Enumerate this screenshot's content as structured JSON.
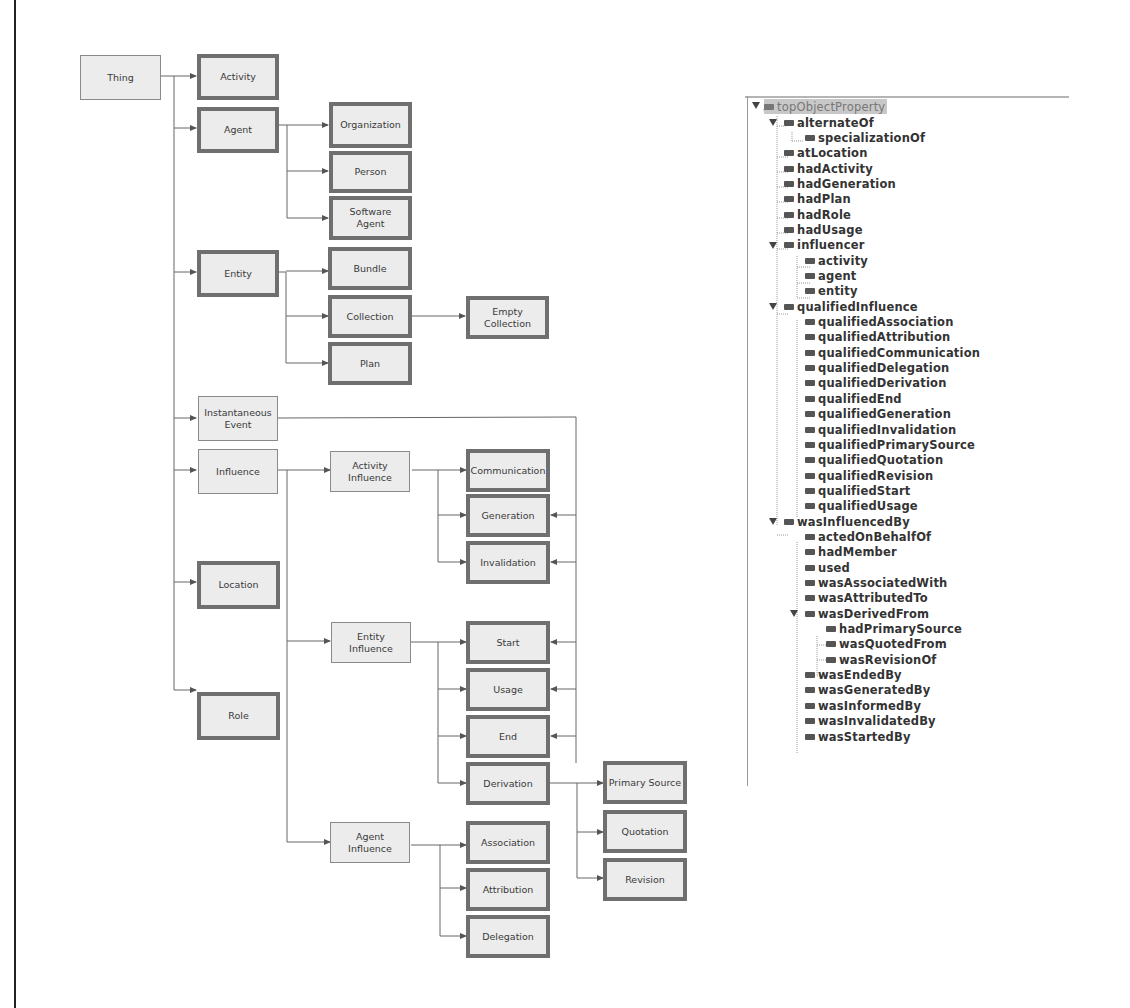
{
  "diagram": {
    "nodes": {
      "thing": "Thing",
      "activity": "Activity",
      "agent": "Agent",
      "organization": "Organization",
      "person": "Person",
      "software_agent": "Software\nAgent",
      "entity": "Entity",
      "bundle": "Bundle",
      "collection": "Collection",
      "empty_collection": "Empty\nCollection",
      "plan": "Plan",
      "instantaneous_event": "Instantaneous\nEvent",
      "influence": "Influence",
      "location": "Location",
      "role": "Role",
      "activity_influence": "Activity\nInfluence",
      "communication": "Communication",
      "generation": "Generation",
      "invalidation": "Invalidation",
      "entity_influence": "Entity\nInfluence",
      "start": "Start",
      "usage": "Usage",
      "end": "End",
      "derivation": "Derivation",
      "primary_source": "Primary Source",
      "quotation": "Quotation",
      "revision": "Revision",
      "agent_influence": "Agent\nInfluence",
      "association": "Association",
      "attribution": "Attribution",
      "delegation": "Delegation"
    }
  },
  "property_tree": {
    "root": "topObjectProperty",
    "items": [
      {
        "label": "alternateOf",
        "depth": 1,
        "expanded": true
      },
      {
        "label": "specializationOf",
        "depth": 2
      },
      {
        "label": "atLocation",
        "depth": 1
      },
      {
        "label": "hadActivity",
        "depth": 1
      },
      {
        "label": "hadGeneration",
        "depth": 1
      },
      {
        "label": "hadPlan",
        "depth": 1
      },
      {
        "label": "hadRole",
        "depth": 1
      },
      {
        "label": "hadUsage",
        "depth": 1
      },
      {
        "label": "influencer",
        "depth": 1,
        "expanded": true
      },
      {
        "label": "activity",
        "depth": 2
      },
      {
        "label": "agent",
        "depth": 2
      },
      {
        "label": "entity",
        "depth": 2
      },
      {
        "label": "qualifiedInfluence",
        "depth": 1,
        "expanded": true
      },
      {
        "label": "qualifiedAssociation",
        "depth": 2
      },
      {
        "label": "qualifiedAttribution",
        "depth": 2
      },
      {
        "label": "qualifiedCommunication",
        "depth": 2
      },
      {
        "label": "qualifiedDelegation",
        "depth": 2
      },
      {
        "label": "qualifiedDerivation",
        "depth": 2
      },
      {
        "label": "qualifiedEnd",
        "depth": 2
      },
      {
        "label": "qualifiedGeneration",
        "depth": 2
      },
      {
        "label": "qualifiedInvalidation",
        "depth": 2
      },
      {
        "label": "qualifiedPrimarySource",
        "depth": 2
      },
      {
        "label": "qualifiedQuotation",
        "depth": 2
      },
      {
        "label": "qualifiedRevision",
        "depth": 2
      },
      {
        "label": "qualifiedStart",
        "depth": 2
      },
      {
        "label": "qualifiedUsage",
        "depth": 2
      },
      {
        "label": "wasInfluencedBy",
        "depth": 1,
        "expanded": true
      },
      {
        "label": "actedOnBehalfOf",
        "depth": 2
      },
      {
        "label": "hadMember",
        "depth": 2
      },
      {
        "label": "used",
        "depth": 2
      },
      {
        "label": "wasAssociatedWith",
        "depth": 2
      },
      {
        "label": "wasAttributedTo",
        "depth": 2
      },
      {
        "label": "wasDerivedFrom",
        "depth": 2,
        "expanded": true
      },
      {
        "label": "hadPrimarySource",
        "depth": 3
      },
      {
        "label": "wasQuotedFrom",
        "depth": 3
      },
      {
        "label": "wasRevisionOf",
        "depth": 3
      },
      {
        "label": "wasEndedBy",
        "depth": 2
      },
      {
        "label": "wasGeneratedBy",
        "depth": 2
      },
      {
        "label": "wasInformedBy",
        "depth": 2
      },
      {
        "label": "wasInvalidatedBy",
        "depth": 2
      },
      {
        "label": "wasStartedBy",
        "depth": 2
      }
    ]
  },
  "colors": {
    "node_fill": "#ececec",
    "thick_border": "#6f6f6f",
    "thin_border": "#8a8a8a",
    "edge": "#555555",
    "selected_row": "#c8c8c8"
  }
}
